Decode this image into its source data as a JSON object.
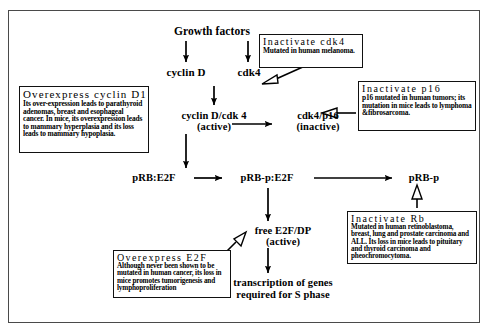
{
  "diagram": {
    "line_color": "#000000",
    "box_border_color": "#111111",
    "background": "#ffffff"
  },
  "nodes": {
    "growth_factors": "Growth factors",
    "cyclin_d": "cyclin D",
    "cdk4": "cdk4",
    "cyclin_d_cdk4_line1": "cyclin D/cdk 4",
    "cyclin_d_cdk4_line2": "(active)",
    "cdk4_p16_line1": "cdk4/p16",
    "cdk4_p16_line2": "(inactive)",
    "prb_e2f": "pRB:E2F",
    "prb_p_e2f": "pRB-p:E2F",
    "prb_p": "pRB-p",
    "free_e2f_line1": "free E2F/DP",
    "free_e2f_line2": "(active)",
    "transcription_line1": "transcription of genes",
    "transcription_line2": "required for S phase"
  },
  "annotation_boxes": {
    "cyclin_d1": {
      "title": "Overexpress  cyclin  D1",
      "body": "Its over-expression leads to parathyroid adenomas, breast and esophageal cancer. In mice, its overexpression leads to mammary hyperplasia and its loss leads to mammary hypoplasia."
    },
    "cdk4": {
      "title": "Inactivate  cdk4",
      "body": "Mutated in human melanoma."
    },
    "p16": {
      "title": "Inactivate  p16",
      "body": "p16 mutated in human tumors; its mutation in mice leads to lymphoma &fibrosarcoma."
    },
    "rb": {
      "title": "Inactivate  Rb",
      "body": "Mutated in human retinoblastoma, breast, lung and prostate carcinoma and ALL. Its loss in mice leads to pituitary and thyroid carcinoma and pheochromocytoma."
    },
    "e2f": {
      "title": "Overexpress  E2F",
      "body": "Although never been shown to be mutated in human cancer, its loss in mice promotes tumorigenesis and lymphoproliferation"
    }
  }
}
